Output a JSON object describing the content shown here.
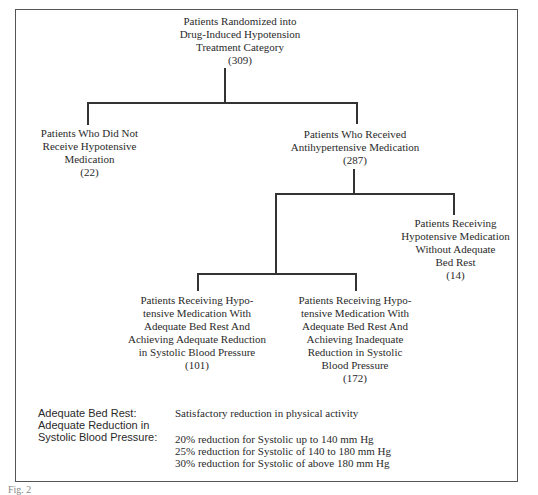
{
  "diagram": {
    "type": "flowchart-tree",
    "nodes": {
      "root": {
        "lines": [
          "Patients Randomized into",
          "Drug-Induced Hypotension",
          "Treatment Category"
        ],
        "count": "(309)"
      },
      "no_med": {
        "lines": [
          "Patients Who Did Not",
          "Receive Hypotensive",
          "Medication"
        ],
        "count": "(22)"
      },
      "received": {
        "lines": [
          "Patients Who Received",
          "Antihypertensive Medication"
        ],
        "count": "(287)"
      },
      "no_bed_rest": {
        "lines": [
          "Patients Receiving",
          "Hypotensive Medication",
          "Without Adequate",
          "Bed Rest"
        ],
        "count": "(14)"
      },
      "adequate_reduction": {
        "lines": [
          "Patients Receiving Hypo-",
          "tensive Medication With",
          "Adequate Bed Rest And",
          "Achieving Adequate Reduction",
          "in Systolic Blood Pressure"
        ],
        "count": "(101)"
      },
      "inadequate_reduction": {
        "lines": [
          "Patients Receiving Hypo-",
          "tensive Medication With",
          "Adequate Bed Rest And",
          "Achieving Inadequate",
          "Reduction in Systolic",
          "Blood Pressure"
        ],
        "count": "(172)"
      }
    },
    "edges": [
      [
        "root",
        "no_med"
      ],
      [
        "root",
        "received"
      ],
      [
        "received",
        "no_bed_rest"
      ],
      [
        "received",
        "adequate_reduction"
      ],
      [
        "received",
        "inadequate_reduction"
      ]
    ]
  },
  "legend": {
    "bed_rest_label": "Adequate Bed Rest:",
    "bed_rest_value": "Satisfactory reduction in physical activity",
    "reduction_label_1": "Adequate Reduction in",
    "reduction_label_2": "Systolic Blood Pressure:",
    "reduction_values": [
      "20% reduction for Systolic up to 140 mm Hg",
      "25% reduction for Systolic of 140 to 180 mm Hg",
      "30% reduction for Systolic of above 180 mm Hg"
    ]
  },
  "caption": "Fig. 2"
}
